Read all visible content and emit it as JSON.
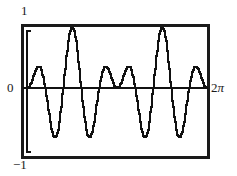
{
  "figure": {
    "name": "waveform-plot"
  },
  "labels": {
    "y_max": "1",
    "y_zero": "0",
    "y_min": "−1",
    "x_max_number": "2",
    "x_max_symbol": "π"
  },
  "colors": {
    "ink": "#111111",
    "background": "#ffffff",
    "frame": "#1a1a1a"
  },
  "chart_data": {
    "type": "line",
    "title": "",
    "xlabel": "",
    "ylabel": "",
    "xlim": [
      0,
      6.283185307179586
    ],
    "ylim": [
      -1,
      1
    ],
    "xtick_labels": [
      "0",
      "2π"
    ],
    "ytick_labels": [
      "−1",
      "0",
      "1"
    ],
    "grid": false,
    "legend": false,
    "series": [
      {
        "name": "modulated-wave",
        "formula": "sin(x) * sin(5x)",
        "samples": 280,
        "peaks_y": [
          0.95,
          0.95,
          0.95,
          0.95
        ],
        "troughs_y": [
          -0.95,
          -0.95,
          -0.95,
          -0.95
        ],
        "major_peak_count": 4,
        "major_trough_count": 4
      }
    ]
  },
  "geometry": {
    "frame_left": 22,
    "frame_top": 25,
    "frame_right": 208,
    "frame_bottom": 158,
    "zero_line_y": 88,
    "bracket_left_x": 27,
    "bracket_top_y": 31,
    "bracket_bottom_y": 152
  }
}
